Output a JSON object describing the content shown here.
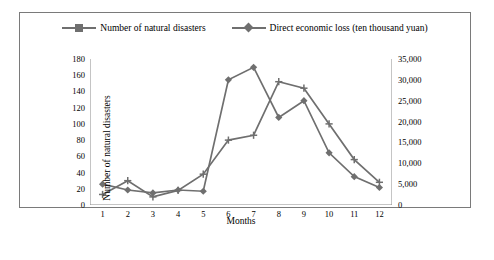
{
  "chart_data": {
    "type": "line",
    "title": "",
    "xlabel": "Months",
    "ylabel_left": "Number of natural disasters",
    "ylabel_right": "Direct economic loss (ten thousand yuan)",
    "categories": [
      "1",
      "2",
      "3",
      "4",
      "5",
      "6",
      "7",
      "8",
      "9",
      "10",
      "11",
      "12"
    ],
    "x_ticklabels": [
      "1",
      "2",
      "3",
      "4",
      "5",
      "6",
      "7",
      "8",
      "9",
      "10",
      "11",
      "12"
    ],
    "y_left_ticklabels": [
      "0",
      "20",
      "40",
      "60",
      "80",
      "100",
      "120",
      "140",
      "160",
      "180"
    ],
    "y_right_ticklabels": [
      "0",
      "5,000",
      "10,000",
      "15,000",
      "20,000",
      "25,000",
      "30,000",
      "35,000"
    ],
    "ylim_left": [
      0,
      180
    ],
    "ylim_right": [
      0,
      35000
    ],
    "grid": false,
    "legend_position": "top-center",
    "series": [
      {
        "name": "Number of natural disasters",
        "axis": "left",
        "marker": "cross",
        "color": "#6f6f6f",
        "values": [
          13,
          30,
          10,
          18,
          38,
          80,
          86,
          152,
          144,
          100,
          56,
          28
        ]
      },
      {
        "name": "Direct economic loss (ten thousand yuan)",
        "axis": "right",
        "marker": "diamond",
        "color": "#6f6f6f",
        "values": [
          5000,
          3600,
          2900,
          3600,
          3300,
          30000,
          33000,
          21000,
          25000,
          12500,
          6800,
          4200
        ]
      }
    ]
  },
  "legend": [
    {
      "label": "Number of natural disasters",
      "marker": "cross"
    },
    {
      "label": "Direct economic loss (ten thousand yuan)",
      "marker": "diamond"
    }
  ]
}
